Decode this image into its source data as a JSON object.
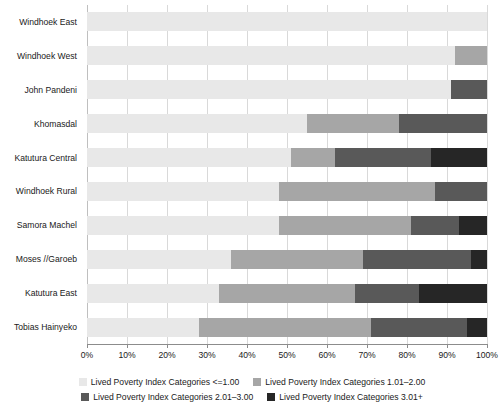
{
  "chart_data": {
    "type": "bar",
    "orientation": "horizontal",
    "stacked": true,
    "normalized_percent": true,
    "title": "",
    "subtitle": "",
    "xlabel": "",
    "ylabel": "",
    "xlim": [
      0,
      100
    ],
    "xticks": [
      0,
      10,
      20,
      30,
      40,
      50,
      60,
      70,
      80,
      90,
      100
    ],
    "xticklabels": [
      "0%",
      "10%",
      "20%",
      "30%",
      "40%",
      "50%",
      "60%",
      "70%",
      "80%",
      "90%",
      "100%"
    ],
    "grid": "vertical",
    "legend_position": "bottom",
    "categories": [
      "Windhoek East",
      "Windhoek West",
      "John Pandeni",
      "Khomasdal",
      "Katutura Central",
      "Windhoek Rural",
      "Samora Machel",
      "Moses //Garoeb",
      "Katutura East",
      "Tobias Hainyeko"
    ],
    "series": [
      {
        "name": "Lived Poverty Index Categories <=1.00",
        "color": "#e8e8e8",
        "values": [
          100,
          92,
          91,
          55,
          51,
          48,
          48,
          36,
          33,
          28
        ]
      },
      {
        "name": "Lived Poverty Index Categories 1.01–2.00",
        "color": "#a6a6a6",
        "values": [
          0,
          8,
          0,
          23,
          11,
          39,
          33,
          33,
          34,
          43
        ]
      },
      {
        "name": "Lived Poverty Index Categories 2.01–3.00",
        "color": "#595959",
        "values": [
          0,
          0,
          9,
          22,
          24,
          13,
          12,
          27,
          16,
          24
        ]
      },
      {
        "name": "Lived Poverty Index Categories 3.01+",
        "color": "#262626",
        "values": [
          0,
          0,
          0,
          0,
          14,
          0,
          7,
          4,
          17,
          5
        ]
      }
    ]
  },
  "legend": {
    "items": [
      {
        "label": "Lived Poverty Index Categories <=1.00",
        "color": "#e8e8e8"
      },
      {
        "label": "Lived Poverty Index Categories 1.01–2.00",
        "color": "#a6a6a6"
      },
      {
        "label": "Lived Poverty Index Categories 2.01–3.00",
        "color": "#595959"
      },
      {
        "label": "Lived Poverty Index Categories 3.01+",
        "color": "#262626"
      }
    ]
  }
}
